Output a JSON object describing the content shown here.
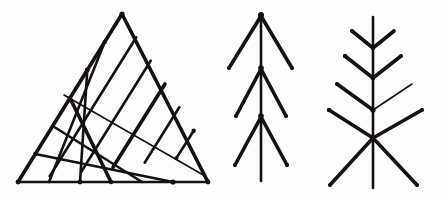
{
  "sheet": {
    "width": 446,
    "height": 197,
    "background_color": "#fdfdfb",
    "ink_color": "#14110f",
    "medium": "scanned pen-and-ink line drawing",
    "caption": "",
    "panel_count": 3
  },
  "panels": [
    {
      "id": "panel-triangle-lattice",
      "name": "triangle-lattice",
      "label": "",
      "description": "Isosceles triangle filled with a rhombic lattice of lines drawn parallel to the two slanted sides",
      "geometry": {
        "apex": [
          122,
          14
        ],
        "base_left": [
          18,
          182
        ],
        "base_right": [
          208,
          182
        ],
        "lattice_divisions_left": 6,
        "lattice_divisions_right": 6,
        "cell_shape": "rhombus"
      }
    },
    {
      "id": "panel-branching-tree",
      "name": "branching-tree",
      "label": "",
      "description": "Vertical trunk with three levels of paired branches splaying downward and outward from nodes on the trunk",
      "geometry": {
        "trunk_x": 261,
        "trunk_top_y": 15,
        "trunk_bottom_y": 181,
        "node_count": 3,
        "node_y_values": [
          15,
          68,
          116
        ],
        "branch_pairs": 3
      }
    },
    {
      "id": "panel-fir-herringbone",
      "name": "fir-herringbone",
      "label": "",
      "description": "Vertical trunk crossed by four chevron pairs of increasing length pointing downward, terminating in a large X crossing near the base",
      "geometry": {
        "trunk_x": 373,
        "trunk_top_y": 17,
        "trunk_bottom_y": 188,
        "chevron_count": 4,
        "chevron_vertex_y_values": [
          48,
          78,
          110,
          138
        ],
        "cross_center": [
          373,
          138
        ]
      }
    }
  ],
  "annotations": {
    "title": "",
    "notes": ""
  }
}
